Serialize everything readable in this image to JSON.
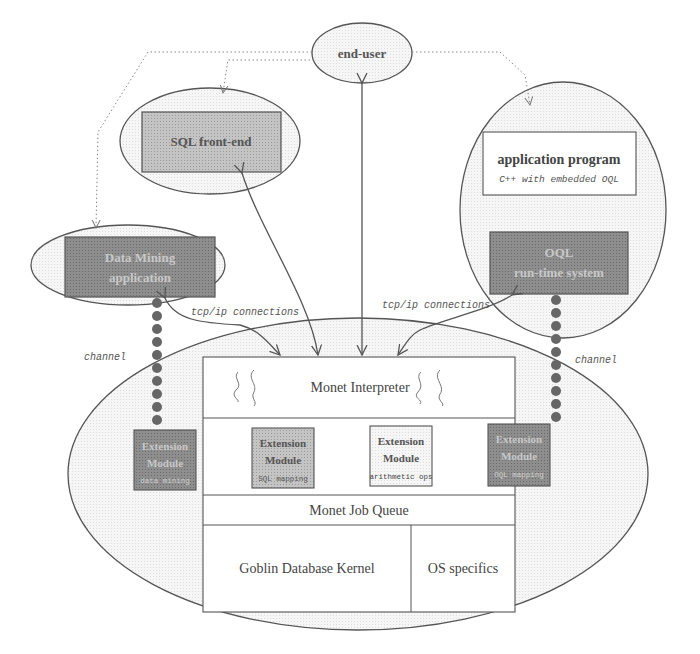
{
  "colors": {
    "stroke": "#555555",
    "light_fill": "#f3f3f3",
    "mid_fill": "#bdbdbd",
    "dark_fill": "#8c8c8c",
    "white": "#ffffff",
    "text": "#444444",
    "dot": "#666666"
  },
  "nodes": {
    "end_user": {
      "label": "end-user"
    },
    "sql_frontend": {
      "label": "SQL front-end"
    },
    "data_mining": {
      "line1": "Data Mining",
      "line2": "application"
    },
    "application_program": {
      "title": "application program",
      "subtitle": "C++ with embedded OQL"
    },
    "oql_runtime": {
      "line1": "OQL",
      "line2": "run-time system"
    },
    "monet_interpreter": {
      "label": "Monet Interpreter"
    },
    "extension_modules": [
      {
        "line1": "Extension",
        "line2": "Module",
        "sub": "data mining"
      },
      {
        "line1": "Extension",
        "line2": "Module",
        "sub": "SQL mapping"
      },
      {
        "line1": "Extension",
        "line2": "Module",
        "sub": "arithmetic ops"
      },
      {
        "line1": "Extension",
        "line2": "Module",
        "sub": "OQL mapping"
      }
    ],
    "monet_job_queue": {
      "label": "Monet Job Queue"
    },
    "goblin_kernel": {
      "label": "Goblin Database Kernel"
    },
    "os_specifics": {
      "label": "OS specifics"
    }
  },
  "edge_labels": {
    "tcp_left": "tcp/ip connections",
    "tcp_right": "tcp/ip connections",
    "channel_left": "channel",
    "channel_right": "channel"
  }
}
